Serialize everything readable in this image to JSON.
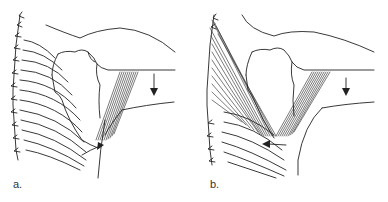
{
  "figure": {
    "panels": [
      {
        "label": "a.",
        "description": "Shoulder and rib cage line drawing showing one hatched muscle band from under the arm to the lower scapula, with a downward arrow on the arm and a curved arrow near the lower scapula."
      },
      {
        "label": "b.",
        "description": "Shoulder and rib cage line drawing showing two hatched muscle bands (one along the spine, one from under the arm) converging near the lower scapula, with a downward arrow on the arm and a leftward arrow at the lower scapula."
      }
    ],
    "colors": {
      "ink": "#222222",
      "background": "#ffffff"
    }
  }
}
